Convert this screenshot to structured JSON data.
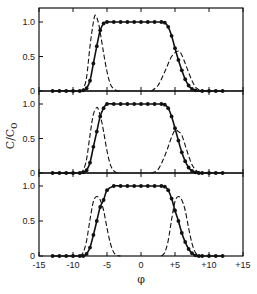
{
  "chart_data": {
    "type": "line",
    "title": "",
    "xlabel": "φ",
    "ylabel": "C/C₀",
    "xlim": [
      -15,
      15
    ],
    "ylim": [
      0,
      1.2
    ],
    "x_ticks": [
      "-15",
      "-10",
      "-5",
      "0",
      "+5",
      "+10",
      "+15"
    ],
    "x_tick_values": [
      -15,
      -10,
      -5,
      0,
      5,
      10,
      15
    ],
    "y_ticks": [
      "0",
      "0.5",
      "1.0"
    ],
    "y_tick_values": [
      0,
      0.5,
      1.0
    ],
    "grid": false,
    "legend": null,
    "panels": [
      {
        "name": "top",
        "series": [
          {
            "name": "total (solid with dots)",
            "style": "solid-markers",
            "x": [
              -13,
              -12,
              -11,
              -10,
              -9,
              -8.5,
              -8,
              -7.5,
              -7,
              -6.5,
              -6,
              -5.5,
              -5,
              -4,
              -3,
              -2,
              -1,
              0,
              1,
              2,
              3,
              3.5,
              4,
              4.5,
              5,
              5.5,
              6,
              6.5,
              7,
              7.5,
              8,
              9,
              10,
              11,
              12
            ],
            "y": [
              0,
              0,
              0,
              0,
              0,
              0.01,
              0.04,
              0.15,
              0.4,
              0.65,
              0.88,
              0.98,
              1.0,
              1.0,
              1.0,
              1.0,
              1.0,
              1.0,
              1.0,
              1.0,
              1.0,
              0.99,
              0.93,
              0.8,
              0.62,
              0.45,
              0.3,
              0.17,
              0.08,
              0.03,
              0.01,
              0,
              0,
              0,
              0
            ]
          },
          {
            "name": "left component (dashed)",
            "style": "dashed",
            "x": [
              -9,
              -8.5,
              -8,
              -7.5,
              -7,
              -6.7,
              -6.3,
              -6,
              -5.5,
              -5,
              -4.5,
              -4,
              -3.5,
              -3
            ],
            "y": [
              0,
              0.03,
              0.2,
              0.65,
              1.0,
              1.1,
              1.0,
              0.85,
              0.55,
              0.28,
              0.1,
              0.03,
              0.005,
              0
            ]
          },
          {
            "name": "right component (dashed)",
            "style": "dashed",
            "x": [
              1.5,
              2.5,
              3.5,
              4.5,
              5.5,
              6,
              6.5,
              7,
              7.5,
              8,
              8.5,
              9
            ],
            "y": [
              0,
              0.08,
              0.28,
              0.5,
              0.58,
              0.52,
              0.4,
              0.27,
              0.15,
              0.06,
              0.02,
              0
            ]
          }
        ]
      },
      {
        "name": "middle",
        "series": [
          {
            "name": "total (solid with dots)",
            "style": "solid-markers",
            "x": [
              -13,
              -12,
              -11,
              -10,
              -9,
              -8.5,
              -8,
              -7.5,
              -7,
              -6.5,
              -6,
              -5.5,
              -5,
              -4,
              -3,
              -2,
              -1,
              0,
              1,
              2,
              3,
              3.5,
              4,
              4.5,
              5,
              5.5,
              6,
              6.5,
              7,
              7.5,
              8,
              8.5,
              9,
              10,
              11,
              12
            ],
            "y": [
              0,
              0,
              0,
              0,
              0,
              0.01,
              0.04,
              0.15,
              0.38,
              0.6,
              0.82,
              0.94,
              1.0,
              1.0,
              1.0,
              1.0,
              1.0,
              1.0,
              1.0,
              1.0,
              1.0,
              0.99,
              0.94,
              0.82,
              0.65,
              0.47,
              0.3,
              0.17,
              0.08,
              0.03,
              0.01,
              0,
              0,
              0,
              0,
              0
            ]
          },
          {
            "name": "left component (dashed)",
            "style": "dashed",
            "x": [
              -9,
              -8.5,
              -8,
              -7.5,
              -7,
              -6.5,
              -6.2,
              -5.8,
              -5.5,
              -5,
              -4.5,
              -4,
              -3.5,
              -3
            ],
            "y": [
              0,
              0.04,
              0.2,
              0.55,
              0.85,
              0.95,
              0.9,
              0.75,
              0.6,
              0.32,
              0.12,
              0.03,
              0.005,
              0
            ]
          },
          {
            "name": "right component (dashed)",
            "style": "dashed",
            "x": [
              1.5,
              2.5,
              3.5,
              4.5,
              5,
              5.5,
              6,
              6.5,
              7,
              7.5,
              8,
              8.5,
              9
            ],
            "y": [
              0,
              0.05,
              0.25,
              0.52,
              0.62,
              0.6,
              0.55,
              0.4,
              0.25,
              0.12,
              0.05,
              0.01,
              0
            ]
          }
        ]
      },
      {
        "name": "bottom",
        "series": [
          {
            "name": "total (solid with dots)",
            "style": "solid-markers",
            "x": [
              -13,
              -12,
              -11,
              -10,
              -9,
              -8.5,
              -8,
              -7.5,
              -7,
              -6.5,
              -6,
              -5.5,
              -5,
              -4,
              -3,
              -2,
              -1,
              0,
              1,
              2,
              3,
              3.5,
              4,
              4.5,
              5,
              5.5,
              6,
              6.5,
              7,
              7.5,
              8,
              8.5,
              9,
              10,
              11,
              12
            ],
            "y": [
              0,
              0,
              0,
              0,
              0,
              0,
              0.03,
              0.12,
              0.3,
              0.5,
              0.7,
              0.8,
              0.94,
              1.0,
              1.0,
              1.0,
              1.0,
              1.0,
              1.0,
              1.0,
              1.0,
              0.99,
              0.94,
              0.82,
              0.65,
              0.5,
              0.33,
              0.2,
              0.1,
              0.04,
              0.01,
              0,
              0,
              0,
              0,
              0
            ]
          },
          {
            "name": "left component (dashed)",
            "style": "dashed",
            "x": [
              -9,
              -8.5,
              -8,
              -7.5,
              -7,
              -6.5,
              -6,
              -5.5,
              -5,
              -4.5,
              -4,
              -3.5,
              -3
            ],
            "y": [
              0,
              0.05,
              0.22,
              0.52,
              0.78,
              0.85,
              0.8,
              0.65,
              0.4,
              0.18,
              0.05,
              0.01,
              0
            ]
          },
          {
            "name": "right component (dashed)",
            "style": "dashed",
            "x": [
              3,
              3.5,
              4,
              4.5,
              5,
              5.5,
              6,
              6.5,
              7,
              7.5,
              8,
              8.5,
              9
            ],
            "y": [
              0,
              0.05,
              0.22,
              0.52,
              0.78,
              0.85,
              0.8,
              0.65,
              0.4,
              0.18,
              0.05,
              0.01,
              0
            ]
          }
        ]
      }
    ]
  },
  "labels": {
    "xlabel": "φ",
    "ylabel_main": "C/C",
    "ylabel_sub": "o"
  }
}
